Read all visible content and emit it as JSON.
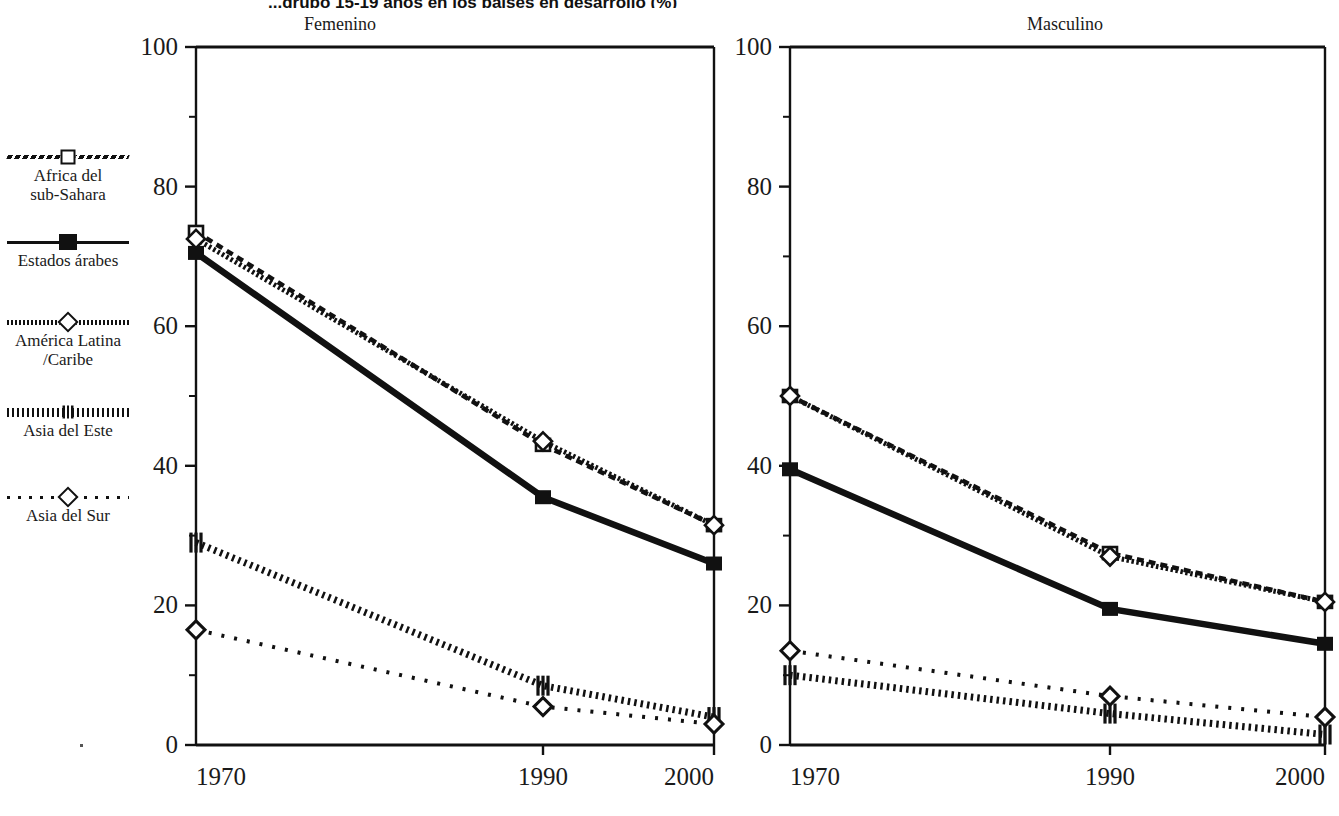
{
  "figure": {
    "label": "",
    "title": "...grupo 15-19 años en los países en desarrollo (%)",
    "y_axis_max": 100
  },
  "legend": {
    "items": [
      {
        "label_line1": "Africa del",
        "label_line2": "sub-Sahara",
        "icon": "dashed-line-square-marker-icon",
        "key": "africa"
      },
      {
        "label_line1": "Estados árabes",
        "label_line2": "",
        "icon": "solid-line-filled-square-marker-icon",
        "key": "arabes"
      },
      {
        "label_line1": "América Latina",
        "label_line2": "/Caribe",
        "icon": "beaded-line-diamond-marker-icon",
        "key": "latina"
      },
      {
        "label_line1": "Asia del Este",
        "label_line2": "",
        "icon": "dotted-line-bars-marker-icon",
        "key": "este"
      },
      {
        "label_line1": "Asia del Sur",
        "label_line2": "",
        "icon": "sparse-dotted-line-diamond-marker-icon",
        "key": "sur"
      }
    ]
  },
  "panels": [
    {
      "title": "Femenino",
      "key": "femenino"
    },
    {
      "title": "Masculino",
      "key": "masculino"
    }
  ],
  "chart_data": {
    "type": "line",
    "title": "...grupo 15-19 años en los países en desarrollo (%)",
    "xlabel": "",
    "ylabel": "",
    "ylim": [
      0,
      100
    ],
    "yticks": [
      0,
      20,
      40,
      60,
      80,
      100
    ],
    "yticks_minor": [
      10,
      30,
      50,
      70,
      90
    ],
    "x": [
      1970,
      1990,
      2000
    ],
    "xticklabels": [
      "1970",
      "1990",
      "2000"
    ],
    "grid": false,
    "legend_position": "left-outside",
    "panels": [
      {
        "name": "Femenino",
        "series": [
          {
            "name": "Africa del sub-Sahara",
            "values": [
              73.5,
              43.0,
              31.5
            ]
          },
          {
            "name": "Estados árabes",
            "values": [
              70.5,
              35.5,
              26.0
            ]
          },
          {
            "name": "América Latina /Caribe",
            "values": [
              72.5,
              43.5,
              31.5
            ]
          },
          {
            "name": "Asia del Este",
            "values": [
              29.0,
              8.5,
              4.0
            ]
          },
          {
            "name": "Asia del Sur",
            "values": [
              16.5,
              5.5,
              3.0
            ]
          }
        ]
      },
      {
        "name": "Masculino",
        "series": [
          {
            "name": "Africa del sub-Sahara",
            "values": [
              50.0,
              27.5,
              20.5
            ]
          },
          {
            "name": "Estados árabes",
            "values": [
              39.5,
              19.5,
              14.5
            ]
          },
          {
            "name": "América Latina /Caribe",
            "values": [
              50.0,
              27.0,
              20.5
            ]
          },
          {
            "name": "Asia del Este",
            "values": [
              10.0,
              4.5,
              1.5
            ]
          },
          {
            "name": "Asia del Sur",
            "values": [
              13.5,
              7.0,
              4.0
            ]
          }
        ]
      }
    ],
    "annotations": [
      {
        "text": "Asia del Sur line is highest at 2000 in Femenino panel (38)",
        "panel": "Femenino"
      }
    ],
    "femenino_asia_sur_override": [
      16.5,
      5.5,
      3.0
    ],
    "note_line_styles": {
      "africa": "dashed with open square markers",
      "arabes": "solid thick with filled square markers",
      "latina": "beaded/chain with open diamond markers",
      "este": "dotted with vertical bar markers",
      "sur": "sparse dotted with open diamond markers"
    }
  }
}
